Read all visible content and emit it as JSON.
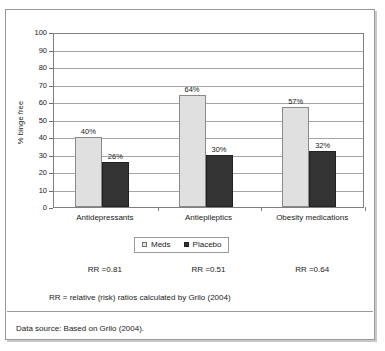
{
  "figure": {
    "data_source_note": "Data source: Based on Grilo (2004).",
    "rr_footnote": "RR = relative (risk) ratios calculated by Grilo (2004)",
    "rr_annotations": [
      {
        "label": "RR =0.81"
      },
      {
        "label": "RR =0.51"
      },
      {
        "label": "RR =0.64"
      }
    ]
  },
  "colors": {
    "meds_fill": "#e0e0e0",
    "meds_border": "#8a8a8a",
    "placebo_fill": "#333333",
    "placebo_border": "#222222",
    "gridline": "#a6a6a6",
    "axis": "#808080",
    "frame": "#9a9a9a",
    "text": "#1a1a1a"
  },
  "chart_data": {
    "type": "bar",
    "title": "",
    "subtitle": "",
    "xlabel": "",
    "ylabel": "% binge free",
    "ylim": [
      0,
      100
    ],
    "yticks": [
      0,
      10,
      20,
      30,
      40,
      50,
      60,
      70,
      80,
      90,
      100
    ],
    "ytick_labels": [
      "0",
      "10",
      "20",
      "30",
      "40",
      "50",
      "60",
      "70",
      "80",
      "90",
      "100"
    ],
    "grid": true,
    "grid_axis": "y",
    "legend_position": "bottom-center",
    "categories": [
      "Antidepressants",
      "Antiepileptics",
      "Obesity medications"
    ],
    "series": [
      {
        "name": "Meds",
        "values": [
          40,
          64,
          57
        ],
        "labels": [
          "40%",
          "64%",
          "57%"
        ]
      },
      {
        "name": "Placebo",
        "values": [
          26,
          30,
          32
        ],
        "labels": [
          "26%",
          "30%",
          "32%"
        ]
      }
    ],
    "annotations": [
      "RR =0.81",
      "RR =0.51",
      "RR =0.64",
      "RR = relative (risk) ratios calculated by Grilo (2004)",
      "Data source: Based on Grilo (2004)."
    ]
  }
}
